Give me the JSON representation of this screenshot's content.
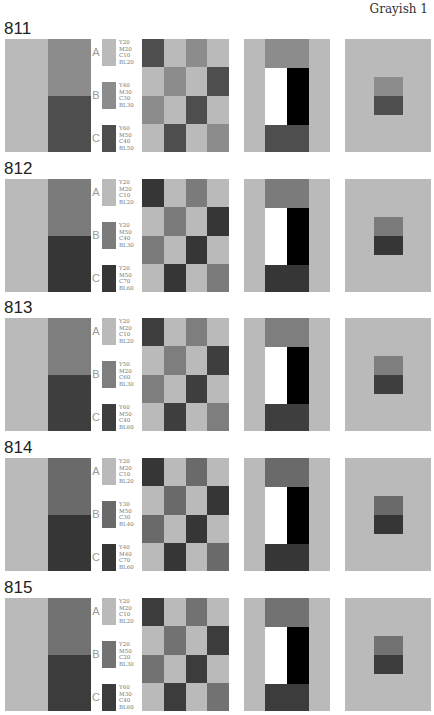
{
  "page": {
    "label": "Grayish 1"
  },
  "sections": [
    {
      "id": "811",
      "colors": {
        "A": "#bababa",
        "B": "#8c8c8c",
        "C": "#4e4e4e"
      },
      "swatches": [
        {
          "letter": "A",
          "code": "Y20\nM20\nC10\nBL20"
        },
        {
          "letter": "B",
          "code": "Y40\nM30\nC30\nBL30"
        },
        {
          "letter": "C",
          "code": "Y60\nM50\nC40\nBL50"
        }
      ]
    },
    {
      "id": "812",
      "colors": {
        "A": "#bababa",
        "B": "#7b7b7b",
        "C": "#363636"
      },
      "swatches": [
        {
          "letter": "A",
          "code": "Y20\nM20\nC10\nBL20"
        },
        {
          "letter": "B",
          "code": "Y20\nM50\nC40\nBL30"
        },
        {
          "letter": "C",
          "code": "Y20\nM50\nC70\nBL60"
        }
      ]
    },
    {
      "id": "813",
      "colors": {
        "A": "#bababa",
        "B": "#7e7e7e",
        "C": "#3e3e3e"
      },
      "swatches": [
        {
          "letter": "A",
          "code": "Y20\nM20\nC10\nBL20"
        },
        {
          "letter": "B",
          "code": "Y50\nM20\nC60\nBL30"
        },
        {
          "letter": "C",
          "code": "Y60\nM50\nC40\nBL60"
        }
      ]
    },
    {
      "id": "814",
      "colors": {
        "A": "#bababa",
        "B": "#6a6a6a",
        "C": "#363636"
      },
      "swatches": [
        {
          "letter": "A",
          "code": "Y20\nM20\nC10\nBL20"
        },
        {
          "letter": "B",
          "code": "Y30\nM50\nC30\nBL40"
        },
        {
          "letter": "C",
          "code": "Y40\nM40\nC70\nBL60"
        }
      ]
    },
    {
      "id": "815",
      "colors": {
        "A": "#bababa",
        "B": "#727272",
        "C": "#3c3c3c"
      },
      "swatches": [
        {
          "letter": "A",
          "code": "Y20\nM20\nC10\nBL20"
        },
        {
          "letter": "B",
          "code": "Y20\nM50\nC20\nBL30"
        },
        {
          "letter": "C",
          "code": "Y60\nM30\nC40\nBL60"
        }
      ]
    }
  ],
  "checker_pattern": [
    "C",
    "A",
    "B",
    "A",
    "A",
    "B",
    "A",
    "C",
    "B",
    "A",
    "C",
    "A",
    "A",
    "C",
    "A",
    "B"
  ]
}
